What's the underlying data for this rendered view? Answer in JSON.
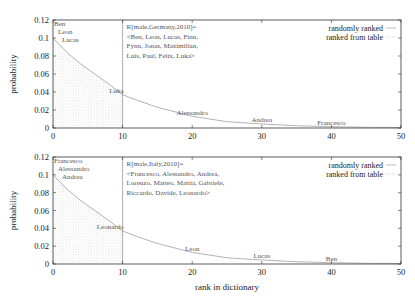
{
  "chart_data": [
    {
      "type": "line",
      "panel": "top",
      "xlabel": "",
      "ylabel": "probability",
      "xlim": [
        0,
        50
      ],
      "ylim": [
        0,
        0.12
      ],
      "xticks": [
        "0",
        "10",
        "20",
        "30",
        "40",
        "50"
      ],
      "yticks": [
        "0",
        "0.02",
        "0.04",
        "0.06",
        "0.08",
        "0.1",
        "0.12"
      ],
      "annotation": [
        "R[male,Germany,2010]=",
        "<Ben, Leon, Lucas, Finn,",
        "Fynn, Jonas, Maximilian,",
        "Luis, Paul, Felix, Luka>"
      ],
      "point_labels": [
        {
          "text": "Ben",
          "x": 1,
          "y": 0.117
        },
        {
          "text": "Leon",
          "x": 2,
          "y": 0.111
        },
        {
          "text": "Lucas",
          "x": 3,
          "y": 0.105
        },
        {
          "text": "Luka",
          "x": 10,
          "y": 0.037
        },
        {
          "text": "Alessandro",
          "x": 20,
          "y": 0.012
        },
        {
          "text": "Andrea",
          "x": 30,
          "y": 0.004
        },
        {
          "text": "Francesco",
          "x": 40,
          "y": 0.001
        }
      ],
      "series": [
        {
          "name": "randomly ranked",
          "x": [
            0,
            2,
            4,
            6,
            8,
            10,
            12,
            15,
            20,
            25,
            30,
            35,
            40,
            45,
            50
          ],
          "values": [
            0.1,
            0.084,
            0.071,
            0.06,
            0.049,
            0.037,
            0.031,
            0.023,
            0.013,
            0.007,
            0.0045,
            0.0025,
            0.0015,
            0.0008,
            0.0005
          ]
        },
        {
          "name": "ranked from table",
          "x": [
            0,
            10
          ],
          "values": [
            0.1,
            0.037
          ],
          "style": "dotted-fill"
        }
      ],
      "legend": [
        "randomly ranked",
        "ranked from table"
      ],
      "legend_position": "top-right"
    },
    {
      "type": "line",
      "panel": "bottom",
      "xlabel": "rank in dictionary",
      "ylabel": "probability",
      "xlim": [
        0,
        50
      ],
      "ylim": [
        0,
        0.12
      ],
      "xticks": [
        "0",
        "10",
        "20",
        "30",
        "40",
        "50"
      ],
      "yticks": [
        "0",
        "0.02",
        "0.04",
        "0.06",
        "0.08",
        "0.1",
        "0.12"
      ],
      "annotation": [
        "R[male,Italy,2010]=",
        "<Francesco, Alessandro, Andrea,",
        "Lorenzo, Matteo, Mattia, Gabriele,",
        "Riccardo, Davide, Leonardo>"
      ],
      "point_labels": [
        {
          "text": "Francesco",
          "x": 1,
          "y": 0.117
        },
        {
          "text": "Alessandro",
          "x": 2,
          "y": 0.111
        },
        {
          "text": "Andrea",
          "x": 3,
          "y": 0.105
        },
        {
          "text": "Leonardo",
          "x": 10,
          "y": 0.037
        },
        {
          "text": "Leon",
          "x": 20,
          "y": 0.012
        },
        {
          "text": "Lucas",
          "x": 30,
          "y": 0.004
        },
        {
          "text": "Ben",
          "x": 40,
          "y": 0.001
        }
      ],
      "series": [
        {
          "name": "randomly ranked",
          "x": [
            0,
            2,
            4,
            6,
            8,
            10,
            12,
            15,
            20,
            25,
            30,
            35,
            40,
            45,
            50
          ],
          "values": [
            0.1,
            0.084,
            0.071,
            0.06,
            0.049,
            0.037,
            0.031,
            0.023,
            0.013,
            0.007,
            0.0045,
            0.0025,
            0.0015,
            0.0008,
            0.0005
          ]
        },
        {
          "name": "ranked from table",
          "x": [
            0,
            10
          ],
          "values": [
            0.1,
            0.037
          ],
          "style": "dotted-fill"
        }
      ],
      "legend": [
        "randomly ranked",
        "ranked from table"
      ],
      "legend_position": "top-right"
    }
  ]
}
